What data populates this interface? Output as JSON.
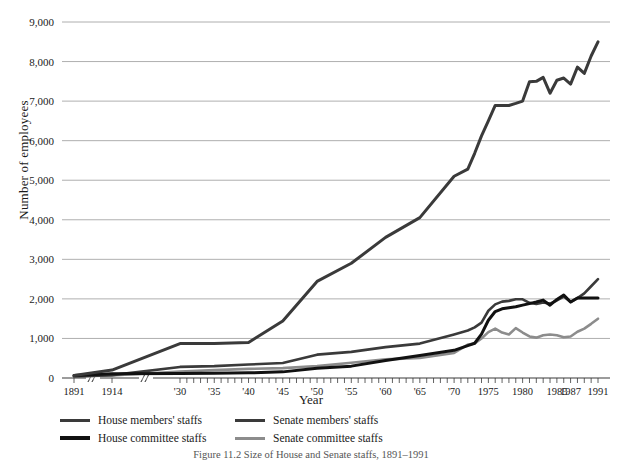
{
  "chart_data": {
    "type": "line",
    "title": "",
    "caption": "Figure 11.2 Size of House and Senate staffs, 1891–1991",
    "xlabel": "Year",
    "ylabel": "Number of employees",
    "ylim": [
      0,
      9000
    ],
    "grid": true,
    "legend_position": "below",
    "ytick_labels": [
      "0",
      "1,000",
      "2,000",
      "3,000",
      "4,000",
      "5,000",
      "6,000",
      "7,000",
      "8,000",
      "9,000"
    ],
    "ytick_values": [
      0,
      1000,
      2000,
      3000,
      4000,
      5000,
      6000,
      7000,
      8000,
      9000
    ],
    "xtick_labels": [
      "1891",
      "1914",
      "'30",
      "'35",
      "'40",
      "'45",
      "'50",
      "'55",
      "'60",
      "'65",
      "'70",
      "1975",
      "1980",
      "1985",
      "1987",
      "1991"
    ],
    "xtick_values": [
      1891,
      1914,
      1930,
      1935,
      1940,
      1945,
      1950,
      1955,
      1960,
      1965,
      1970,
      1975,
      1980,
      1985,
      1987,
      1991
    ],
    "axis_break_marks": 2,
    "x": [
      1891,
      1914,
      1930,
      1935,
      1940,
      1945,
      1950,
      1955,
      1960,
      1965,
      1970,
      1972,
      1973,
      1974,
      1975,
      1976,
      1977,
      1978,
      1979,
      1980,
      1981,
      1982,
      1983,
      1984,
      1985,
      1986,
      1987,
      1988,
      1989,
      1990,
      1991
    ],
    "series": [
      {
        "name": "House members' staffs",
        "color": "#3a3a3a",
        "width": 3,
        "values": [
          62,
          200,
          870,
          870,
          900,
          1440,
          2441,
          2900,
          3556,
          4055,
          5100,
          5280,
          5680,
          6120,
          6500,
          6890,
          6890,
          6890,
          6942,
          7000,
          7487,
          7500,
          7600,
          7200,
          7528,
          7584,
          7430,
          7860,
          7700,
          8140,
          8500
        ]
      },
      {
        "name": "House committee staffs",
        "color": "#111111",
        "width": 3,
        "values": [
          62,
          105,
          112,
          120,
          130,
          155,
          246,
          300,
          440,
          571,
          700,
          817,
          878,
          1107,
          1460,
          1680,
          1750,
          1776,
          1800,
          1843,
          1880,
          1920,
          1970,
          1840,
          1986,
          2100,
          1920,
          2024,
          2024,
          2024,
          2024
        ]
      },
      {
        "name": "Senate members' staffs",
        "color": "#3a3a3a",
        "width": 2.6,
        "values": [
          39,
          72,
          280,
          300,
          340,
          380,
          590,
          660,
          780,
          870,
          1100,
          1200,
          1280,
          1400,
          1700,
          1862,
          1930,
          1950,
          1990,
          1989,
          1900,
          1870,
          1910,
          1880,
          1960,
          2060,
          1920,
          2020,
          2140,
          2320,
          2500
        ]
      },
      {
        "name": "Senate committee staffs",
        "color": "#8c8c8c",
        "width": 2.6,
        "values": [
          41,
          64,
          163,
          200,
          230,
          250,
          300,
          386,
          470,
          509,
          635,
          844,
          873,
          1000,
          1160,
          1250,
          1150,
          1100,
          1260,
          1150,
          1050,
          1020,
          1080,
          1100,
          1080,
          1030,
          1050,
          1170,
          1250,
          1370,
          1500
        ]
      }
    ]
  },
  "legend": {
    "items": [
      {
        "label": "House members' staffs",
        "color": "#3a3a3a"
      },
      {
        "label": "House committee staffs",
        "color": "#111111"
      },
      {
        "label": "Senate members' staffs",
        "color": "#3a3a3a"
      },
      {
        "label": "Senate committee staffs",
        "color": "#8c8c8c"
      }
    ]
  },
  "axis": {
    "ylabel": "Number of employees",
    "xlabel": "Year"
  },
  "caption": "Figure 11.2 Size of House and Senate staffs, 1891–1991"
}
